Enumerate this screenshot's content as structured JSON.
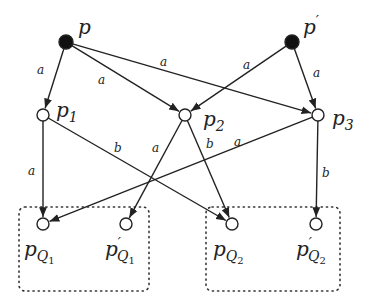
{
  "diagram": {
    "type": "directed-graph",
    "nodes": [
      {
        "id": "p",
        "label": "p",
        "sub": "",
        "prime": "",
        "x": 66,
        "y": 42,
        "filled": true,
        "lx": 78,
        "ly": 34
      },
      {
        "id": "pprime",
        "label": "p",
        "sub": "",
        "prime": "′",
        "x": 292,
        "y": 42,
        "filled": true,
        "lx": 303,
        "ly": 34
      },
      {
        "id": "p1",
        "label": "p",
        "sub": "1",
        "prime": "",
        "x": 43,
        "y": 115,
        "filled": false,
        "lx": 56,
        "ly": 117
      },
      {
        "id": "p2",
        "label": "p",
        "sub": "2",
        "prime": "",
        "x": 185,
        "y": 115,
        "filled": false,
        "lx": 203,
        "ly": 126
      },
      {
        "id": "p3",
        "label": "p",
        "sub": "3",
        "prime": "",
        "x": 318,
        "y": 115,
        "filled": false,
        "lx": 332,
        "ly": 125
      },
      {
        "id": "pQ1",
        "label": "p",
        "sub": "Q",
        "subsub": "1",
        "prime": "",
        "x": 43,
        "y": 224,
        "filled": false,
        "lx": 24,
        "ly": 256
      },
      {
        "id": "pprimeQ1",
        "label": "p",
        "sub": "Q",
        "subsub": "1",
        "prime": "′",
        "x": 126,
        "y": 224,
        "filled": false,
        "lx": 105,
        "ly": 256
      },
      {
        "id": "pQ2",
        "label": "p",
        "sub": "Q",
        "subsub": "2",
        "prime": "",
        "x": 232,
        "y": 224,
        "filled": false,
        "lx": 213,
        "ly": 256
      },
      {
        "id": "pprimeQ2",
        "label": "p",
        "sub": "Q",
        "subsub": "2",
        "prime": "′",
        "x": 316,
        "y": 224,
        "filled": false,
        "lx": 296,
        "ly": 256
      }
    ],
    "edges": [
      {
        "from": "p",
        "to": "p1",
        "label": "a",
        "lx": 37,
        "ly": 74
      },
      {
        "from": "p",
        "to": "p2",
        "label": "a",
        "lx": 98,
        "ly": 84
      },
      {
        "from": "p",
        "to": "p3",
        "label": "a",
        "lx": 160,
        "ly": 66
      },
      {
        "from": "pprime",
        "to": "p2",
        "label": "a",
        "lx": 243,
        "ly": 69
      },
      {
        "from": "pprime",
        "to": "p3",
        "label": "a",
        "lx": 313,
        "ly": 77
      },
      {
        "from": "p1",
        "to": "pQ1",
        "label": "a",
        "lx": 28,
        "ly": 175
      },
      {
        "from": "p1",
        "to": "pQ2",
        "label": "b",
        "lx": 114,
        "ly": 152
      },
      {
        "from": "p2",
        "to": "pprimeQ1",
        "label": "a",
        "lx": 152,
        "ly": 152
      },
      {
        "from": "p2",
        "to": "pQ2",
        "label": "b",
        "lx": 206,
        "ly": 148
      },
      {
        "from": "p3",
        "to": "pQ1",
        "label": "a",
        "lx": 234,
        "ly": 146
      },
      {
        "from": "p3",
        "to": "pprimeQ2",
        "label": "b",
        "lx": 322,
        "ly": 177
      }
    ],
    "groups": [
      {
        "id": "Q1-group",
        "x": 19,
        "y": 207,
        "w": 130,
        "h": 84
      },
      {
        "id": "Q2-group",
        "x": 206,
        "y": 207,
        "w": 134,
        "h": 84
      }
    ],
    "colors": {
      "stroke": "#222222",
      "filled": "#111111",
      "hollow": "#ffffff"
    }
  }
}
